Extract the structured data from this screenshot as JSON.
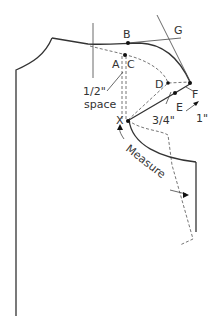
{
  "diagram": {
    "type": "sewing-pattern-armhole",
    "points": {
      "A": "A",
      "B": "B",
      "C": "C",
      "D": "D",
      "E": "E",
      "F": "F",
      "G": "G",
      "X": "X"
    },
    "annotations": {
      "half_inch": "1/2\"",
      "space": "space",
      "three_quarter": "3/4\"",
      "one_inch": "1\"",
      "measure": "Measure"
    },
    "colors": {
      "line": "#333333",
      "dashed": "#666666",
      "background": "#ffffff"
    }
  }
}
